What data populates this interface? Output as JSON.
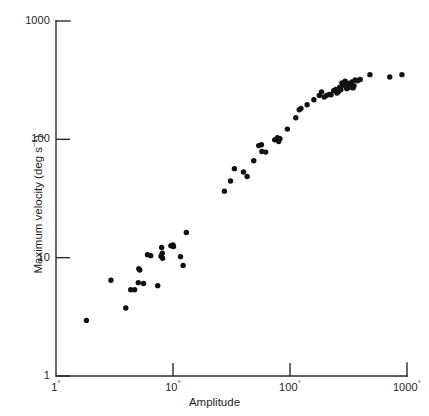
{
  "chart_data": {
    "type": "scatter",
    "title": "",
    "xlabel": "Amplitude",
    "ylabel": "Maximum velocity (deg s⁻¹)",
    "xscale": "log",
    "yscale": "log",
    "xlim": [
      1,
      1000
    ],
    "ylim": [
      1,
      1000
    ],
    "grid": false,
    "legend": null,
    "x_tick_labels": [
      "1°",
      "10°",
      "100°",
      "1000°"
    ],
    "x_tick_values": [
      1,
      10,
      100,
      1000
    ],
    "y_tick_labels": [
      "1",
      "10",
      "100",
      "1000"
    ],
    "y_tick_values": [
      1,
      10,
      100,
      1000
    ],
    "series": [
      {
        "name": "saccades",
        "marker": "circle",
        "color": "#111111",
        "points": [
          [
            1.82,
            2.95
          ],
          [
            2.95,
            6.45
          ],
          [
            3.95,
            3.75
          ],
          [
            4.35,
            5.35
          ],
          [
            4.7,
            5.35
          ],
          [
            5.05,
            6.15
          ],
          [
            5.1,
            8.05
          ],
          [
            5.2,
            7.85
          ],
          [
            5.6,
            6.05
          ],
          [
            6.05,
            10.6
          ],
          [
            6.45,
            10.4
          ],
          [
            7.4,
            5.8
          ],
          [
            7.9,
            10.3
          ],
          [
            8.0,
            12.2
          ],
          [
            8.1,
            10.9
          ],
          [
            8.15,
            9.9
          ],
          [
            9.6,
            12.6
          ],
          [
            10.0,
            12.8
          ],
          [
            10.1,
            12.4
          ],
          [
            11.6,
            10.2
          ],
          [
            12.2,
            8.6
          ],
          [
            13.0,
            16.3
          ],
          [
            27.5,
            36.5
          ],
          [
            31.0,
            44.5
          ],
          [
            33.5,
            56.5
          ],
          [
            40.0,
            53.0
          ],
          [
            43.0,
            48.5
          ],
          [
            49.0,
            66.0
          ],
          [
            54.0,
            88.5
          ],
          [
            57.0,
            90.0
          ],
          [
            57.5,
            79.0
          ],
          [
            62.0,
            78.0
          ],
          [
            74.0,
            99.0
          ],
          [
            78.0,
            103.0
          ],
          [
            79.0,
            100.0
          ],
          [
            80.0,
            96.0
          ],
          [
            82.0,
            101.0
          ],
          [
            95.0,
            122.0
          ],
          [
            112.0,
            152.0
          ],
          [
            120.0,
            178.0
          ],
          [
            124.0,
            182.0
          ],
          [
            140.0,
            196.0
          ],
          [
            160.0,
            216.0
          ],
          [
            178.0,
            235.0
          ],
          [
            186.0,
            252.0
          ],
          [
            196.0,
            228.0
          ],
          [
            205.0,
            235.0
          ],
          [
            216.0,
            240.0
          ],
          [
            224.0,
            238.0
          ],
          [
            236.0,
            258.0
          ],
          [
            246.0,
            264.0
          ],
          [
            252.0,
            246.0
          ],
          [
            258.0,
            252.0
          ],
          [
            266.0,
            276.0
          ],
          [
            272.0,
            262.0
          ],
          [
            278.0,
            300.0
          ],
          [
            284.0,
            292.0
          ],
          [
            290.0,
            286.0
          ],
          [
            296.0,
            310.0
          ],
          [
            302.0,
            276.0
          ],
          [
            306.0,
            268.0
          ],
          [
            312.0,
            282.0
          ],
          [
            318.0,
            296.0
          ],
          [
            324.0,
            276.0
          ],
          [
            330.0,
            288.0
          ],
          [
            338.0,
            306.0
          ],
          [
            346.0,
            272.0
          ],
          [
            352.0,
            284.0
          ],
          [
            360.0,
            318.0
          ],
          [
            378.0,
            312.0
          ],
          [
            398.0,
            320.0
          ],
          [
            482.0,
            352.0
          ],
          [
            712.0,
            336.0
          ],
          [
            905.0,
            352.0
          ]
        ]
      }
    ]
  },
  "axes": {
    "x_title": "Amplitude",
    "y_title_parts": {
      "main": "Maximum velocity (deg s",
      "exponent": "−1",
      "tail": ")"
    },
    "x_ticks": [
      {
        "label_main": "1",
        "degree": "°",
        "value": 1
      },
      {
        "label_main": "10",
        "degree": "°",
        "value": 10
      },
      {
        "label_main": "100",
        "degree": "°",
        "value": 100
      },
      {
        "label_main": "1000",
        "degree": "°",
        "value": 1000
      }
    ],
    "y_ticks": [
      {
        "label": "1000",
        "value": 1000
      },
      {
        "label": "100",
        "value": 100
      },
      {
        "label": "10",
        "value": 10
      },
      {
        "label": "1",
        "value": 1
      }
    ]
  },
  "style": {
    "axis_color": "#2b2b2b",
    "point_color": "#111111",
    "background": "#ffffff"
  }
}
